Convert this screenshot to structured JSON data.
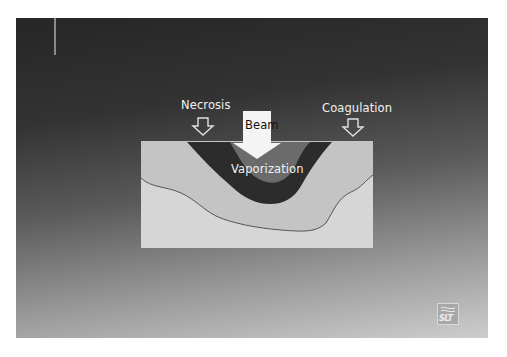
{
  "figure": {
    "labels": {
      "necrosis": "Necrosis",
      "beam": "Beam",
      "coagulation": "Coagulation",
      "vaporization": "Vaporization"
    },
    "logo": {
      "text": "SLT",
      "icon": "wave-lines-icon"
    },
    "caption": {
      "text": ""
    },
    "colors": {
      "slide_top": "#262626",
      "slide_bottom": "#cdcdcd",
      "tissue_upper": "#c6c6c6",
      "tissue_lower": "#d8d8d8",
      "necrosis_zone": "#2c2c2c",
      "vaporization_zone": "#6a6a6a",
      "beam_arrow": "#f4f4f4",
      "outline_arrows": "#e0e0e0",
      "boundary_line": "#555555"
    }
  }
}
